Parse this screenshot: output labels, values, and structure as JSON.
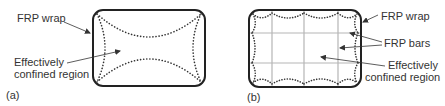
{
  "panel_a": {
    "tag": "(a)",
    "labels": {
      "wrap": "FRP wrap",
      "region_line1": "Effectively",
      "region_line2": "confined region"
    }
  },
  "panel_b": {
    "tag": "(b)",
    "labels": {
      "wrap": "FRP wrap",
      "bars": "FRP bars",
      "region_line1": "Effectively",
      "region_line2": "confined region"
    }
  },
  "colors": {
    "outline": "#222222",
    "dots": "#333333",
    "bars": "#b5b5b5",
    "text": "#333333"
  }
}
